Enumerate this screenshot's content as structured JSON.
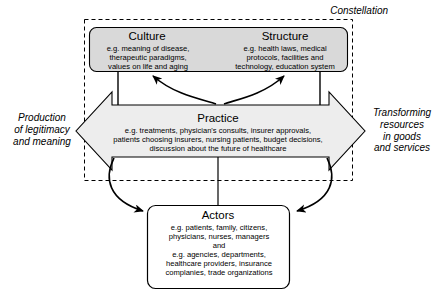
{
  "diagram": {
    "constellation_label": "Constellation",
    "boxes": {
      "culture": {
        "title": "Culture",
        "body": "e.g. meaning of disease,\ntherapeutic paradigms,\nvalues on life and aging",
        "fill": "#d9d9d9",
        "stroke": "#000000"
      },
      "structure": {
        "title": "Structure",
        "body": "e.g. health laws, medical\nprotocols, facilities and\ntechnology, education system",
        "fill": "#d9d9d9",
        "stroke": "#000000"
      },
      "practice": {
        "title": "Practice",
        "body": "e.g. treatments, physician's consults, insurer approvals,\npatients choosing insurers, nursing patients, budget decisions,\ndiscussion about the future of healthcare",
        "fill": "#ededed",
        "stroke": "#000000"
      },
      "actors": {
        "title": "Actors",
        "body": "e.g. patients, family, citizens,\nphysicians, nurses, managers\nand\ne.g. agencies, departments,\nhealthcare providers, insurance\ncomplanies, trade organizations",
        "fill": "#ffffff",
        "stroke": "#000000"
      }
    },
    "captions": {
      "left": "Production\nof legitimacy\nand meaning",
      "right": "Transforming\nresources\nin goods\nand services"
    },
    "colors": {
      "line": "#000000",
      "background": "#ffffff",
      "gray_fill": "#d9d9d9",
      "light_fill": "#ededed"
    }
  }
}
